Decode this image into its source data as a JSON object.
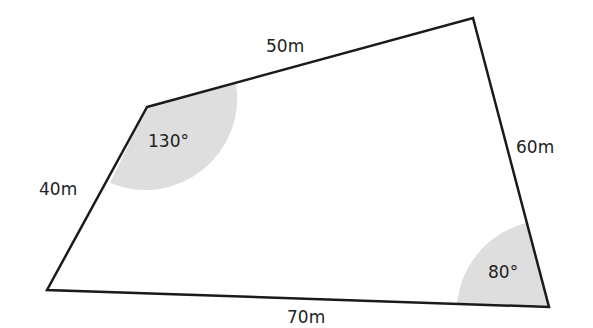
{
  "diagram": {
    "type": "quadrilateral",
    "fill_color": "#ffffff",
    "stroke_color": "#1a1a1a",
    "angle_shade_color": "#dedede",
    "vertices": {
      "top_left": [
        147,
        107
      ],
      "top_right": [
        473,
        18
      ],
      "bottom_right": [
        549,
        307
      ],
      "bottom_left": [
        47,
        290
      ]
    },
    "sides": [
      {
        "id": "top",
        "label": "50m"
      },
      {
        "id": "right",
        "label": "60m"
      },
      {
        "id": "bottom",
        "label": "70m"
      },
      {
        "id": "left",
        "label": "40m"
      }
    ],
    "angles": [
      {
        "id": "top-left",
        "label": "130°"
      },
      {
        "id": "bottom-right",
        "label": "80°"
      }
    ]
  }
}
